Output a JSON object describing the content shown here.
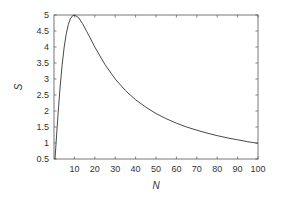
{
  "chart_data": {
    "type": "line",
    "title": "",
    "xlabel": "N",
    "ylabel": "S",
    "xlim": [
      0,
      100
    ],
    "ylim": [
      0.5,
      5
    ],
    "grid": false,
    "legend": null,
    "x_ticks": [
      10,
      20,
      30,
      40,
      50,
      60,
      70,
      80,
      90,
      100
    ],
    "y_ticks": [
      0.5,
      1,
      1.5,
      2,
      2.5,
      3,
      3.5,
      4,
      4.5,
      5
    ],
    "x_tick_labels": [
      "10",
      "20",
      "30",
      "40",
      "50",
      "60",
      "70",
      "80",
      "90",
      "100"
    ],
    "y_tick_labels": [
      "0.5",
      "1",
      "1.5",
      "2",
      "2.5",
      "3",
      "3.5",
      "4",
      "4.5",
      "5"
    ],
    "series": [
      {
        "name": "S(N)",
        "color": "#333333",
        "x": [
          1,
          2,
          3,
          4,
          5,
          6,
          7,
          8,
          9,
          10,
          12,
          14,
          16,
          18,
          20,
          25,
          30,
          35,
          40,
          45,
          50,
          55,
          60,
          65,
          70,
          75,
          80,
          85,
          90,
          95,
          100
        ],
        "y": [
          0.99,
          1.92,
          2.75,
          3.45,
          4.0,
          4.41,
          4.7,
          4.88,
          4.97,
          5.0,
          4.92,
          4.73,
          4.49,
          4.25,
          4.0,
          3.45,
          3.0,
          2.64,
          2.35,
          2.12,
          1.92,
          1.76,
          1.62,
          1.5,
          1.4,
          1.31,
          1.23,
          1.16,
          1.1,
          1.04,
          0.99
        ]
      }
    ]
  }
}
